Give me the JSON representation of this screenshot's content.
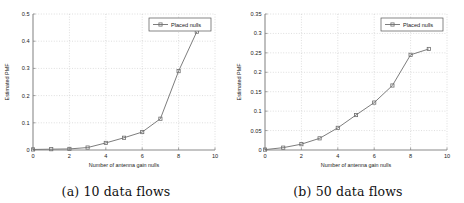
{
  "figure": {
    "subfigures": [
      {
        "id": "a",
        "caption": "(a) 10 data flows",
        "chart_data": {
          "type": "line",
          "title": "",
          "xlabel": "Number of antenna gain nulls",
          "ylabel": "Estimated PMF",
          "xlim": [
            0,
            10
          ],
          "ylim": [
            0,
            0.5
          ],
          "xticks": [
            0,
            2,
            4,
            6,
            8,
            10
          ],
          "xtick_labels": [
            "0",
            "2",
            "4",
            "6",
            "8",
            "10"
          ],
          "yticks": [
            0,
            0.1,
            0.2,
            0.3,
            0.4,
            0.5
          ],
          "ytick_labels": [
            "0",
            "0.1",
            "0.2",
            "0.3",
            "0.4",
            "0.5"
          ],
          "grid": true,
          "legend_position": "top-right",
          "series": [
            {
              "name": "Placed nulls",
              "marker": "square",
              "color": "#6e6e6e",
              "x": [
                0,
                1,
                2,
                3,
                4,
                5,
                6,
                7,
                8,
                9
              ],
              "values": [
                0.002,
                0.003,
                0.004,
                0.009,
                0.026,
                0.045,
                0.066,
                0.115,
                0.29,
                0.435
              ]
            }
          ]
        }
      },
      {
        "id": "b",
        "caption": "(b) 50 data flows",
        "chart_data": {
          "type": "line",
          "title": "",
          "xlabel": "Number of antenna gain nulls",
          "ylabel": "Estimated PMF",
          "xlim": [
            0,
            10
          ],
          "ylim": [
            0,
            0.35
          ],
          "xticks": [
            0,
            2,
            4,
            6,
            8,
            10
          ],
          "xtick_labels": [
            "0",
            "2",
            "4",
            "6",
            "8",
            "10"
          ],
          "yticks": [
            0,
            0.05,
            0.1,
            0.15,
            0.2,
            0.25,
            0.3,
            0.35
          ],
          "ytick_labels": [
            "0",
            "0.05",
            "0.1",
            "0.15",
            "0.2",
            "0.25",
            "0.3",
            "0.35"
          ],
          "grid": true,
          "legend_position": "top-right",
          "series": [
            {
              "name": "Placed nulls",
              "marker": "square",
              "color": "#6e6e6e",
              "x": [
                0,
                1,
                2,
                3,
                4,
                5,
                6,
                7,
                8,
                9
              ],
              "values": [
                0.001,
                0.006,
                0.015,
                0.03,
                0.057,
                0.09,
                0.122,
                0.166,
                0.245,
                0.26
              ]
            }
          ]
        }
      }
    ]
  },
  "style": {
    "line_color": "#6e6e6e",
    "grid_color": "#bdbdbd",
    "axis_color": "#8a8a8a",
    "text_color": "#222222"
  }
}
